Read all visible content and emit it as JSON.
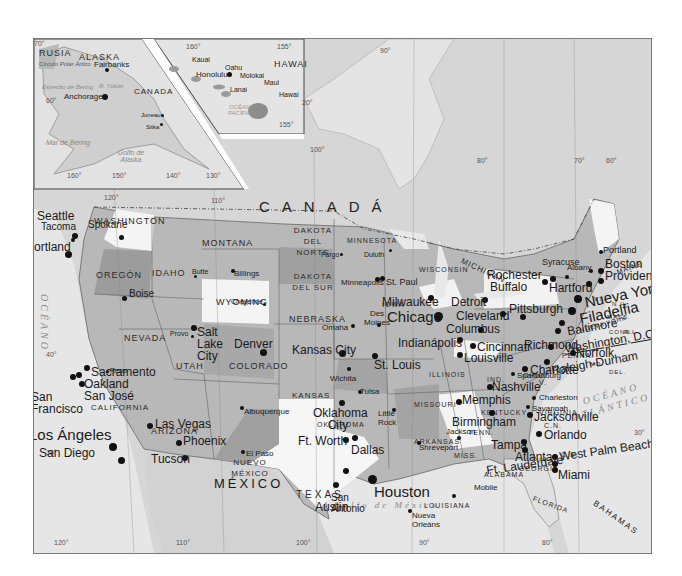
{
  "map": {
    "country_labels": {
      "canada": "CANADÁ",
      "mexico": "MÉXICO",
      "russia": "RUSIA",
      "canada_inset": "CANADA"
    },
    "inset_alaska": {
      "title": "ALASKA",
      "labels": {
        "arctic_circle": "Círculo Polar Ártico",
        "bering_strait": "Estrecho de Bering",
        "yukon": "R. Yukón",
        "bering_sea": "Mar de Bering",
        "gulf_alaska": "Golfo de Alaska"
      },
      "cities": {
        "fairbanks": "Fairbanks",
        "anchorage": "Anchorage",
        "juneau": "Juneau",
        "sitka": "Sitka"
      },
      "degrees": {
        "d70": "70°",
        "d60": "60°",
        "d160": "160°",
        "d150": "150°",
        "d140": "140°",
        "d130": "130°"
      }
    },
    "inset_hawaii": {
      "title": "HAWAI",
      "islands": {
        "kauai": "Kauai",
        "oahu": "Oahu",
        "molokai": "Molokai",
        "maui": "Maui",
        "lanai": "Lanai",
        "hawaii": "Hawai"
      },
      "cities": {
        "honolulu": "Honolulu"
      },
      "ocean": "OCÉANO PACÍFICO",
      "degrees": {
        "d160": "160°",
        "d155": "155°",
        "d155b": "155°",
        "d20": "20°"
      }
    },
    "states": {
      "washington": "WASHINGTON",
      "oregon": "OREGÓN",
      "idaho": "IDAHO",
      "montana": "MONTANA",
      "wyoming": "WYOMING",
      "nevada": "NEVADA",
      "california": "CALIFORNIA",
      "utah": "UTAH",
      "colorado": "COLORADO",
      "arizona": "ARIZONA",
      "new_mexico": "NUEVO MÉXICO",
      "north_dakota": "DAKOTA DEL NORTE",
      "south_dakota": "DAKOTA DEL SUR",
      "nebraska": "NEBRASKA",
      "kansas": "KANSAS",
      "oklahoma": "OKLAHOMA",
      "texas": "TEXAS",
      "minnesota": "MINNESOTA",
      "iowa": "IOWA",
      "missouri": "MISSOURI",
      "arkansas": "ARKANSAS",
      "louisiana": "LOUISIANA",
      "wisconsin": "WISCONSIN",
      "illinois": "ILLINOIS",
      "michigan": "MICHIGAN",
      "indiana": "IND.",
      "ohio": "OHIO",
      "kentucky": "KENTUCKY",
      "tennessee": "TENN.",
      "mississippi": "MISS.",
      "alabama": "ALABAMA",
      "georgia": "GEORGIA",
      "florida": "FLORIDA",
      "south_carolina": "C.S.",
      "north_carolina": "C.N.",
      "virginia": "VIRGINIA",
      "west_virginia": "V.",
      "pennsylvania": "PENNA.",
      "new_york": "NUEVA YORK",
      "vermont": "VT.",
      "new_hampshire": "N.H.",
      "maine": "MAINE",
      "massachusetts": "MASS.",
      "rhode_island": "R.I.",
      "connecticut": "CONN.",
      "delaware": "DEL.",
      "maryland": "MD."
    },
    "cities": {
      "seattle": "Seattle",
      "tacoma": "Tacoma",
      "spokane": "Spokane",
      "portland_or": "Portland",
      "boise": "Boise",
      "butte": "Butte",
      "billings": "Billings",
      "reno": "Reno",
      "sacramento": "Sacramento",
      "oakland": "Oakland",
      "san_francisco": "San Francisco",
      "san_jose": "San José",
      "los_angeles": "Los Ángeles",
      "san_diego": "San Diego",
      "las_vegas": "Las Vegas",
      "salt_lake_city": "Salt Lake City",
      "provo": "Provo",
      "cheyenne": "Cheyenne",
      "denver": "Denver",
      "phoenix": "Phoenix",
      "tucson": "Tucson",
      "albuquerque": "Albuquerque",
      "el_paso": "El Paso",
      "fargo": "Fargo",
      "duluth": "Duluth",
      "minneapolis": "Minneapolis",
      "st_paul": "St. Paul",
      "omaha": "Omaha",
      "des_moines": "Des Moines",
      "milwaukee": "Milwaukee",
      "chicago": "Chicago",
      "kansas_city": "Kansas City",
      "wichita": "Wichita",
      "st_louis": "St. Louis",
      "tulsa": "Tulsa",
      "oklahoma_city": "Oklahoma City",
      "little_rock": "Little Rock",
      "ft_worth": "Ft. Worth",
      "dallas": "Dallas",
      "austin": "Austin",
      "san_antonio": "San Antonio",
      "houston": "Houston",
      "shreveport": "Shreveport",
      "jackson": "Jackson",
      "memphis": "Memphis",
      "nashville": "Nashville",
      "birmingham": "Birmingham",
      "mobile": "Mobile",
      "new_orleans": "Nueva Orleáns",
      "atlanta": "Atlanta",
      "detroit": "Detroit",
      "indianapolis": "Indianápolis",
      "columbus": "Columbus",
      "cleveland": "Cleveland",
      "cincinnati": "Cincinnati",
      "louisville": "Louisville",
      "pittsburgh": "Pittsburgh",
      "buffalo": "Buffalo",
      "rochester": "Rochester",
      "syracuse": "Syracuse",
      "albany": "Albany",
      "portland_me": "Portland",
      "boston": "Boston",
      "providence": "Providence",
      "hartford": "Hartford",
      "new_york": "Nueva York",
      "philadelphia": "Filadelfia",
      "baltimore": "Baltimore",
      "washington_dc": "Washington, D.C.",
      "richmond": "Richmond",
      "norfolk": "Norfolk",
      "raleigh_durham": "Raleigh-Durham",
      "charlotte": "Charlotte",
      "spartanburg": "Spartanburg",
      "charleston": "Charleston",
      "savannah": "Savannah",
      "jacksonville": "Jacksonville",
      "orlando": "Orlando",
      "tampa": "Tampa",
      "west_palm_beach": "West Palm Beach",
      "ft_lauderdale": "Ft. Lauderdale",
      "miami": "Miami"
    },
    "water": {
      "pacific": "OCÉANO",
      "atlantic_1": "OCÉANO",
      "atlantic_2": "ATLÁNTICO",
      "gulf": "Golfo de México",
      "bahamas": "BAHAMAS"
    },
    "degrees": {
      "lon_120_top": "120°",
      "lon_110_top": "110°",
      "lon_100_top": "100°",
      "lon_90_top": "90°",
      "lon_80_top": "80°",
      "lon_70": "70°",
      "lon_60": "60°",
      "lat_40": "40°",
      "lat_30_w": "30°",
      "lat_30_e": "30°",
      "lon_120_bot": "120°",
      "lon_110_bot": "110°",
      "lon_100_bot": "100°",
      "lon_90_bot": "90°",
      "lon_80_bot": "80°"
    }
  }
}
